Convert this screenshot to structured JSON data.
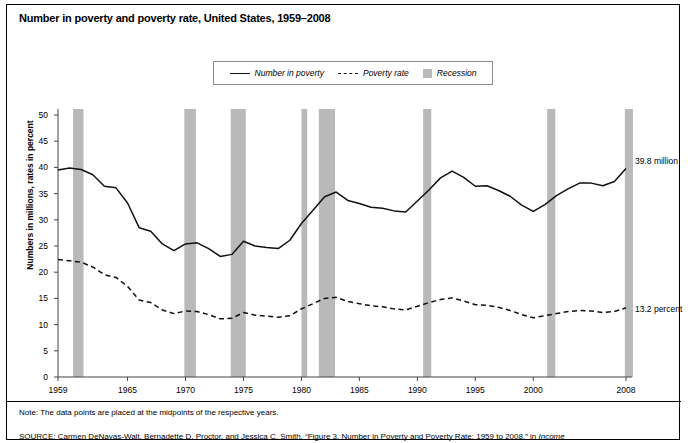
{
  "title": "Number in poverty and poverty rate, United States, 1959–2008",
  "legend": {
    "items": [
      {
        "label": "Number in poverty",
        "style": "solid-line",
        "color": "#111111"
      },
      {
        "label": "Poverty rate",
        "style": "dashed-line",
        "color": "#111111"
      },
      {
        "label": "Recession",
        "style": "filled-box",
        "color": "#b9b9b9"
      }
    ]
  },
  "annotations": {
    "number_end": "39.8 million",
    "rate_end": "13.2 percent"
  },
  "note": "Note: The data points are placed at the midpoints of the respective years.",
  "source": {
    "label": "SOURCE:",
    "text": " Carmen DeNavas-Walt, Bernadette D. Proctor, and Jessica C. Smith, “Figure 3. Number in Poverty and Poverty Rate: 1959 to 2008,” in ",
    "italic_tail": "Income"
  },
  "chart_data": {
    "type": "line",
    "title": "Number in poverty and poverty rate, United States, 1959–2008",
    "xlabel": "",
    "ylabel": "Numbers in millions, rates in percent",
    "xlim": [
      1959,
      2008
    ],
    "ylim": [
      0,
      50
    ],
    "yticks": [
      0,
      5,
      10,
      15,
      20,
      25,
      30,
      35,
      40,
      45,
      50
    ],
    "xticks": [
      1959,
      1965,
      1970,
      1975,
      1980,
      1985,
      1990,
      1995,
      2000,
      2008
    ],
    "grid": false,
    "legend_position": "top-center",
    "x": [
      1959,
      1960,
      1961,
      1962,
      1963,
      1964,
      1965,
      1966,
      1967,
      1968,
      1969,
      1970,
      1971,
      1972,
      1973,
      1974,
      1975,
      1976,
      1977,
      1978,
      1979,
      1980,
      1981,
      1982,
      1983,
      1984,
      1985,
      1986,
      1987,
      1988,
      1989,
      1990,
      1991,
      1992,
      1993,
      1994,
      1995,
      1996,
      1997,
      1998,
      1999,
      2000,
      2001,
      2002,
      2003,
      2004,
      2005,
      2006,
      2007,
      2008
    ],
    "series": [
      {
        "name": "Number in poverty",
        "unit": "millions",
        "style": "solid",
        "values": [
          39.5,
          39.9,
          39.6,
          38.6,
          36.4,
          36.1,
          33.2,
          28.5,
          27.8,
          25.4,
          24.1,
          25.4,
          25.6,
          24.5,
          23.0,
          23.4,
          25.9,
          25.0,
          24.7,
          24.5,
          26.1,
          29.3,
          31.8,
          34.4,
          35.3,
          33.7,
          33.1,
          32.4,
          32.2,
          31.7,
          31.5,
          33.6,
          35.7,
          38.0,
          39.3,
          38.1,
          36.4,
          36.5,
          35.6,
          34.5,
          32.8,
          31.6,
          32.9,
          34.6,
          35.9,
          37.0,
          37.0,
          36.5,
          37.3,
          39.8
        ]
      },
      {
        "name": "Poverty rate",
        "unit": "percent",
        "style": "dashed",
        "values": [
          22.4,
          22.2,
          21.9,
          21.0,
          19.5,
          19.0,
          17.3,
          14.7,
          14.2,
          12.8,
          12.1,
          12.6,
          12.5,
          11.9,
          11.1,
          11.2,
          12.3,
          11.8,
          11.6,
          11.4,
          11.7,
          13.0,
          14.0,
          15.0,
          15.2,
          14.4,
          14.0,
          13.6,
          13.4,
          13.0,
          12.8,
          13.5,
          14.2,
          14.8,
          15.1,
          14.5,
          13.8,
          13.7,
          13.3,
          12.7,
          11.9,
          11.3,
          11.7,
          12.1,
          12.5,
          12.7,
          12.6,
          12.3,
          12.5,
          13.2
        ]
      }
    ],
    "recessions": [
      {
        "start": 1960.3,
        "end": 1961.2
      },
      {
        "start": 1969.9,
        "end": 1970.9
      },
      {
        "start": 1973.9,
        "end": 1975.2
      },
      {
        "start": 1980.0,
        "end": 1980.5
      },
      {
        "start": 1981.5,
        "end": 1982.9
      },
      {
        "start": 1990.5,
        "end": 1991.2
      },
      {
        "start": 2001.2,
        "end": 2001.9
      },
      {
        "start": 2007.9,
        "end": 2008.6
      }
    ]
  }
}
